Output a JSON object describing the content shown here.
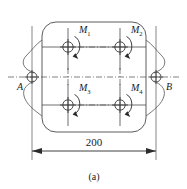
{
  "figure": {
    "caption": "(a)",
    "dimension": {
      "value": "200",
      "arrow_style": "filled-triangle-both-ends"
    },
    "supports": [
      {
        "id": "A",
        "label": "A",
        "side": "left",
        "type": "bearing-support",
        "x": 32,
        "y": 77
      },
      {
        "id": "B",
        "label": "B",
        "side": "right",
        "type": "bearing-support",
        "x": 156,
        "y": 77
      }
    ],
    "bolts": [
      {
        "id": "M1",
        "label": "M",
        "subscript": "1",
        "x": 68,
        "y": 47,
        "row": "top",
        "col": "left"
      },
      {
        "id": "M2",
        "label": "M",
        "subscript": "2",
        "x": 120,
        "y": 47,
        "row": "top",
        "col": "right"
      },
      {
        "id": "M3",
        "label": "M",
        "subscript": "3",
        "x": 68,
        "y": 105,
        "row": "bottom",
        "col": "left"
      },
      {
        "id": "M4",
        "label": "M",
        "subscript": "4",
        "x": 120,
        "y": 105,
        "row": "bottom",
        "col": "right"
      }
    ],
    "body": {
      "shape": "rounded-rectangle",
      "x": 42,
      "y": 22,
      "width": 104,
      "height": 110,
      "corner_radius": 14
    },
    "colors": {
      "stroke": "#4a4a4a",
      "text": "#1a1a1a",
      "background": "#ffffff",
      "arrow": "#2b2b2b"
    }
  }
}
